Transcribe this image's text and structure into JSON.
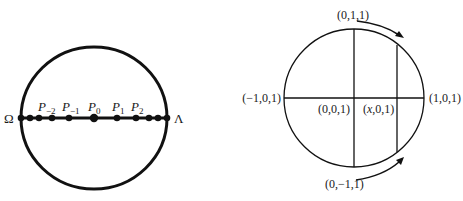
{
  "left_figure": {
    "endpoint_left": "Ω",
    "endpoint_right": "Λ",
    "points": [
      {
        "base": "P",
        "sub": "−2"
      },
      {
        "base": "P",
        "sub": "−1"
      },
      {
        "base": "P",
        "sub": "0"
      },
      {
        "base": "P",
        "sub": "1"
      },
      {
        "base": "P",
        "sub": "2"
      }
    ]
  },
  "right_figure": {
    "top_label": "(0,1,1)",
    "bottom_label": "(0,−1,1)",
    "left_label": "(−1,0,1)",
    "right_label": "(1,0,1)",
    "center_label": "(0,0,1)",
    "x_label_var": "x",
    "x_label_rest": ",0,1)",
    "x_label_open": "("
  },
  "colors": {
    "stroke": "#111111",
    "background": "#ffffff"
  }
}
